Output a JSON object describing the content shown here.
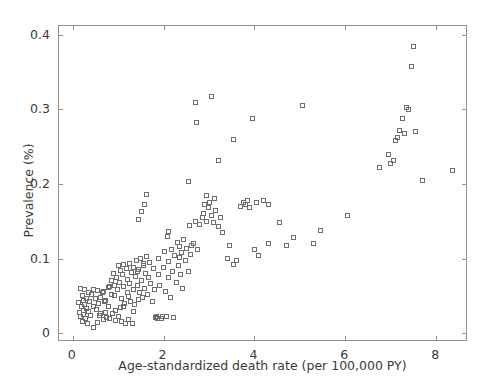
{
  "chart_data": {
    "type": "scatter",
    "title": "",
    "xlabel": "Age-standardized death rate (per 100,000 PY)",
    "ylabel": "Prevalence (%)",
    "xlim": [
      -0.3,
      8.7
    ],
    "ylim": [
      -0.012,
      0.412
    ],
    "xticks": [
      0,
      2,
      4,
      6,
      8
    ],
    "xticklabels": [
      "0",
      "2",
      "4",
      "6",
      "8"
    ],
    "yticks": [
      0,
      0.1,
      0.2,
      0.3,
      0.4
    ],
    "yticklabels": [
      "0",
      "0.1",
      "0.2",
      "0.3",
      "0.4"
    ],
    "grid": false,
    "legend": null,
    "marker": "square-open",
    "marker_color": "#6e6e6e",
    "marker_size": 5,
    "frame_color": "#8f8f8f",
    "text_color": "#3a3a3a",
    "background": "#ffffff",
    "series": [
      {
        "name": "countries",
        "points": [
          [
            0.12,
            0.041
          ],
          [
            0.15,
            0.028
          ],
          [
            0.17,
            0.022
          ],
          [
            0.18,
            0.06
          ],
          [
            0.2,
            0.035
          ],
          [
            0.21,
            0.016
          ],
          [
            0.22,
            0.05
          ],
          [
            0.23,
            0.03
          ],
          [
            0.24,
            0.044
          ],
          [
            0.25,
            0.025
          ],
          [
            0.26,
            0.058
          ],
          [
            0.27,
            0.038
          ],
          [
            0.28,
            0.02
          ],
          [
            0.3,
            0.047
          ],
          [
            0.31,
            0.033
          ],
          [
            0.33,
            0.013
          ],
          [
            0.35,
            0.055
          ],
          [
            0.36,
            0.029
          ],
          [
            0.38,
            0.043
          ],
          [
            0.4,
            0.024
          ],
          [
            0.42,
            0.052
          ],
          [
            0.45,
            0.036
          ],
          [
            0.47,
            0.008
          ],
          [
            0.5,
            0.046
          ],
          [
            0.52,
            0.031
          ],
          [
            0.55,
            0.057
          ],
          [
            0.58,
            0.04
          ],
          [
            0.6,
            0.023
          ],
          [
            0.62,
            0.048
          ],
          [
            0.65,
            0.054
          ],
          [
            0.68,
            0.018
          ],
          [
            0.7,
            0.043
          ],
          [
            0.72,
            0.027
          ],
          [
            0.75,
            0.021
          ],
          [
            0.78,
            0.061
          ],
          [
            0.8,
            0.035
          ],
          [
            0.82,
            0.019
          ],
          [
            0.85,
            0.07
          ],
          [
            0.86,
            0.052
          ],
          [
            0.88,
            0.026
          ],
          [
            0.9,
            0.08
          ],
          [
            0.92,
            0.064
          ],
          [
            0.94,
            0.03
          ],
          [
            0.95,
            0.017
          ],
          [
            0.97,
            0.075
          ],
          [
            0.99,
            0.058
          ],
          [
            1.0,
            0.09
          ],
          [
            1.02,
            0.022
          ],
          [
            1.04,
            0.068
          ],
          [
            1.05,
            0.084
          ],
          [
            1.07,
            0.047
          ],
          [
            1.08,
            0.015
          ],
          [
            1.1,
            0.078
          ],
          [
            1.12,
            0.092
          ],
          [
            1.13,
            0.062
          ],
          [
            1.15,
            0.04
          ],
          [
            1.16,
            0.013
          ],
          [
            1.18,
            0.086
          ],
          [
            1.2,
            0.072
          ],
          [
            1.21,
            0.055
          ],
          [
            1.23,
            0.018
          ],
          [
            1.25,
            0.094
          ],
          [
            1.26,
            0.066
          ],
          [
            1.28,
            0.042
          ],
          [
            1.3,
            0.081
          ],
          [
            1.31,
            0.013
          ],
          [
            1.33,
            0.088
          ],
          [
            1.35,
            0.059
          ],
          [
            1.36,
            0.038
          ],
          [
            1.38,
            0.076
          ],
          [
            1.4,
            0.097
          ],
          [
            1.42,
            0.064
          ],
          [
            1.44,
            0.045
          ],
          [
            1.45,
            0.085
          ],
          [
            1.47,
            0.055
          ],
          [
            1.5,
            0.1
          ],
          [
            1.52,
            0.07
          ],
          [
            1.54,
            0.048
          ],
          [
            1.56,
            0.09
          ],
          [
            1.58,
            0.06
          ],
          [
            1.6,
            0.08
          ],
          [
            1.62,
            0.103
          ],
          [
            1.65,
            0.052
          ],
          [
            1.67,
            0.074
          ],
          [
            1.7,
            0.095
          ],
          [
            1.72,
            0.066
          ],
          [
            1.75,
            0.043
          ],
          [
            1.77,
            0.086
          ],
          [
            1.8,
            0.058
          ],
          [
            1.82,
            0.021
          ],
          [
            1.84,
            0.022
          ],
          [
            1.86,
            0.019
          ],
          [
            1.88,
            0.078
          ],
          [
            1.9,
            0.1
          ],
          [
            1.92,
            0.064
          ],
          [
            1.95,
            0.02
          ],
          [
            1.97,
            0.022
          ],
          [
            2.0,
            0.088
          ],
          [
            2.02,
            0.11
          ],
          [
            2.04,
            0.056
          ],
          [
            2.06,
            0.022
          ],
          [
            2.08,
            0.13
          ],
          [
            2.1,
            0.074
          ],
          [
            2.12,
            0.096
          ],
          [
            2.15,
            0.048
          ],
          [
            2.18,
            0.112
          ],
          [
            2.2,
            0.082
          ],
          [
            2.22,
            0.021
          ],
          [
            2.25,
            0.104
          ],
          [
            2.28,
            0.068
          ],
          [
            2.3,
            0.122
          ],
          [
            2.32,
            0.09
          ],
          [
            2.35,
            0.116
          ],
          [
            2.38,
            0.078
          ],
          [
            2.4,
            0.108
          ],
          [
            2.42,
            0.06
          ],
          [
            2.45,
            0.126
          ],
          [
            2.48,
            0.098
          ],
          [
            2.5,
            0.114
          ],
          [
            2.55,
            0.082
          ],
          [
            2.58,
            0.144
          ],
          [
            2.6,
            0.105
          ],
          [
            2.65,
            0.12
          ],
          [
            2.7,
            0.15
          ],
          [
            2.75,
            0.112
          ],
          [
            2.8,
            0.145
          ],
          [
            2.85,
            0.155
          ],
          [
            2.88,
            0.16
          ],
          [
            2.9,
            0.172
          ],
          [
            2.95,
            0.15
          ],
          [
            3.0,
            0.168
          ],
          [
            3.02,
            0.175
          ],
          [
            3.05,
            0.158
          ],
          [
            3.1,
            0.148
          ],
          [
            3.15,
            0.165
          ],
          [
            3.2,
            0.143
          ],
          [
            3.25,
            0.155
          ],
          [
            3.3,
            0.135
          ],
          [
            3.4,
            0.1
          ],
          [
            3.45,
            0.118
          ],
          [
            3.55,
            0.092
          ],
          [
            3.6,
            0.098
          ],
          [
            3.7,
            0.17
          ],
          [
            3.75,
            0.175
          ],
          [
            3.8,
            0.172
          ],
          [
            3.85,
            0.178
          ],
          [
            3.9,
            0.168
          ],
          [
            4.0,
            0.112
          ],
          [
            4.05,
            0.175
          ],
          [
            4.1,
            0.104
          ],
          [
            4.2,
            0.178
          ],
          [
            4.3,
            0.12
          ],
          [
            1.45,
            0.152
          ],
          [
            1.52,
            0.163
          ],
          [
            1.58,
            0.172
          ],
          [
            1.63,
            0.186
          ],
          [
            2.55,
            0.204
          ],
          [
            2.7,
            0.31
          ],
          [
            2.72,
            0.282
          ],
          [
            3.05,
            0.318
          ],
          [
            3.2,
            0.232
          ],
          [
            3.55,
            0.26
          ],
          [
            3.95,
            0.288
          ],
          [
            4.3,
            0.172
          ],
          [
            4.55,
            0.148
          ],
          [
            4.7,
            0.118
          ],
          [
            4.85,
            0.128
          ],
          [
            5.05,
            0.305
          ],
          [
            5.3,
            0.12
          ],
          [
            5.45,
            0.138
          ],
          [
            6.05,
            0.158
          ],
          [
            6.75,
            0.222
          ],
          [
            6.95,
            0.24
          ],
          [
            7.0,
            0.228
          ],
          [
            7.05,
            0.232
          ],
          [
            7.1,
            0.258
          ],
          [
            7.15,
            0.262
          ],
          [
            7.2,
            0.272
          ],
          [
            7.25,
            0.288
          ],
          [
            7.3,
            0.268
          ],
          [
            7.35,
            0.302
          ],
          [
            7.4,
            0.3
          ],
          [
            7.45,
            0.358
          ],
          [
            7.5,
            0.385
          ],
          [
            7.55,
            0.27
          ],
          [
            7.7,
            0.205
          ],
          [
            8.35,
            0.218
          ],
          [
            0.62,
            0.026
          ],
          [
            0.72,
            0.044
          ],
          [
            0.92,
            0.05
          ],
          [
            1.05,
            0.034
          ],
          [
            1.12,
            0.036
          ],
          [
            1.22,
            0.049
          ],
          [
            1.35,
            0.029
          ],
          [
            0.45,
            0.058
          ],
          [
            0.55,
            0.014
          ],
          [
            0.68,
            0.056
          ],
          [
            0.82,
            0.063
          ],
          [
            1.42,
            0.082
          ],
          [
            1.55,
            0.093
          ],
          [
            2.12,
            0.136
          ],
          [
            2.35,
            0.102
          ],
          [
            2.62,
            0.118
          ],
          [
            2.95,
            0.185
          ],
          [
            3.12,
            0.18
          ]
        ]
      }
    ]
  }
}
